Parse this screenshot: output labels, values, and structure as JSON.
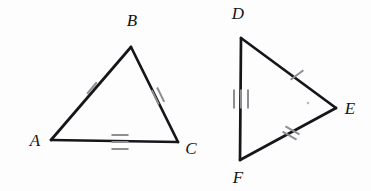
{
  "figure": {
    "background_color": "#fdfdfd",
    "stroke_color": "#15151a",
    "tick_color": "#8d8d92",
    "label_color": "#141414"
  },
  "triangles": [
    {
      "name": "triangle-abc",
      "vertices": [
        {
          "label": "A",
          "x": 51,
          "y": 140,
          "label_x": 35,
          "label_y": 142
        },
        {
          "label": "B",
          "x": 131,
          "y": 47,
          "label_x": 132,
          "label_y": 22
        },
        {
          "label": "C",
          "x": 178,
          "y": 142,
          "label_x": 191,
          "label_y": 150
        }
      ],
      "sides": [
        {
          "name": "side-ab",
          "from": "A",
          "to": "B",
          "tick_count": 1
        },
        {
          "name": "side-bc",
          "from": "B",
          "to": "C",
          "tick_count": 2
        },
        {
          "name": "side-ac",
          "from": "A",
          "to": "C",
          "tick_count": 3
        }
      ]
    },
    {
      "name": "triangle-def",
      "vertices": [
        {
          "label": "D",
          "x": 241,
          "y": 38,
          "label_x": 238,
          "label_y": 15
        },
        {
          "label": "E",
          "x": 336,
          "y": 108,
          "label_x": 350,
          "label_y": 110
        },
        {
          "label": "F",
          "x": 240,
          "y": 160,
          "label_x": 238,
          "label_y": 179
        }
      ],
      "sides": [
        {
          "name": "side-de",
          "from": "D",
          "to": "E",
          "tick_count": 1
        },
        {
          "name": "side-fe",
          "from": "F",
          "to": "E",
          "tick_count": 2
        },
        {
          "name": "side-df",
          "from": "D",
          "to": "F",
          "tick_count": 3
        }
      ]
    }
  ],
  "tick_groups": [
    {
      "name": "tick-side-ab",
      "count": 1,
      "cx": 92,
      "cy": 88,
      "angle": 310,
      "length": 15,
      "spacing": 5
    },
    {
      "name": "tick-side-bc",
      "count": 2,
      "cx": 158,
      "cy": 96,
      "angle": 244,
      "length": 16,
      "spacing": 6
    },
    {
      "name": "tick-side-ac",
      "count": 3,
      "cx": 120,
      "cy": 142,
      "angle": 180,
      "length": 17,
      "spacing": 7
    },
    {
      "name": "tick-side-de",
      "count": 1,
      "cx": 297,
      "cy": 75,
      "angle": 323,
      "length": 16,
      "spacing": 5
    },
    {
      "name": "tick-side-fe",
      "count": 2,
      "cx": 291,
      "cy": 133,
      "angle": 209,
      "length": 16,
      "spacing": 6
    },
    {
      "name": "tick-side-df",
      "count": 3,
      "cx": 241,
      "cy": 99,
      "angle": 270,
      "length": 19,
      "spacing": 7
    }
  ],
  "specks": [
    {
      "name": "page-speck",
      "x": 308,
      "y": 103,
      "r": 1.3
    }
  ]
}
